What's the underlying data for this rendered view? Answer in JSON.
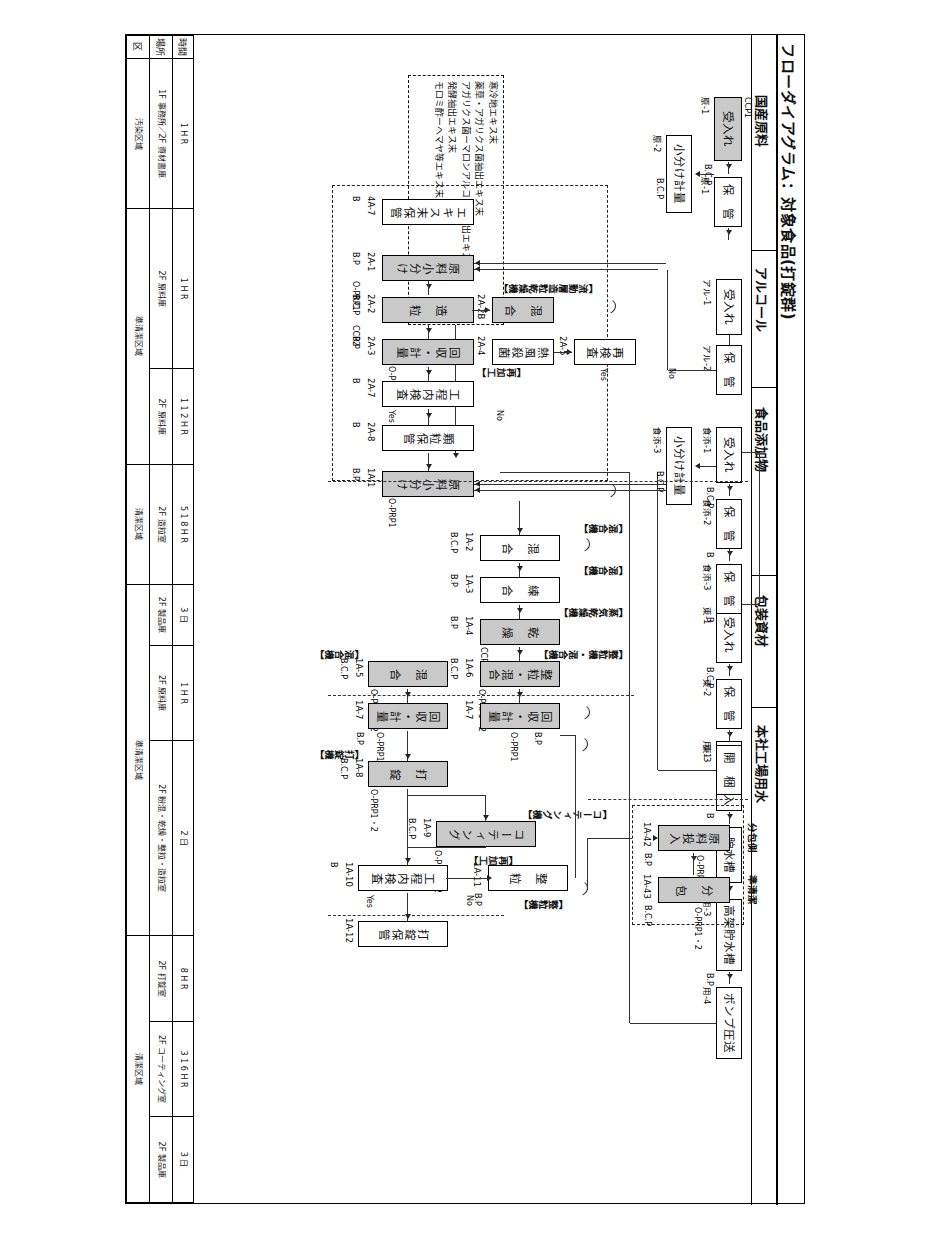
{
  "document": {
    "title": "フローダイアグラム：対象食品(打錠群)",
    "legend_lines": [
      "寒冷地エキス末",
      "薬草・アガリクス菌抽出エキス末",
      "アガリクス菌ーマロンアルコール抽出エキス末",
      "発酵抽出エキス末",
      "モロミ酢ーヘマヤ等エキス末"
    ]
  },
  "lanes": [
    {
      "id": "lane-raw",
      "label": "国産原料"
    },
    {
      "id": "lane-alcohol",
      "label": "アルコール"
    },
    {
      "id": "lane-additive",
      "label": "食品添加物"
    },
    {
      "id": "lane-packaging",
      "label": "包装資材"
    },
    {
      "id": "lane-water",
      "label": "本社工場用水"
    }
  ],
  "water_line": {
    "steps": [
      {
        "code": "用-1",
        "label": "水道水受入",
        "ccp": "",
        "shaded": false
      },
      {
        "code": "用-2",
        "label": "貯水槽",
        "ccp": "B",
        "shaded": false
      },
      {
        "code": "用-3",
        "label": "高架貯水槽",
        "ccp": "B.P",
        "shaded": false
      },
      {
        "code": "用-4",
        "label": "ポンプ圧送",
        "ccp": "B.P",
        "shaded": false
      }
    ]
  },
  "packaging_line": {
    "steps": [
      {
        "code": "東-1",
        "label": "受入れ",
        "ccp": "B.C.P",
        "shaded": false
      },
      {
        "code": "東-2",
        "label": "保　管",
        "ccp": "",
        "shaded": false
      },
      {
        "code": "東-3",
        "label": "開　梱",
        "ccp": "",
        "shaded": false
      }
    ]
  },
  "additive_line": {
    "steps": [
      {
        "code": "食添-1",
        "label": "受入れ",
        "ccp": "B.C.P",
        "shaded": false
      },
      {
        "code": "食添-2",
        "label": "保　管",
        "ccp": "B",
        "shaded": false
      },
      {
        "code": "食添-3",
        "label": "保　管",
        "ccp": "B",
        "shaded": false
      },
      {
        "code": "食添-3",
        "label": "小分け計量",
        "ccp": "B.C.P",
        "shaded": false
      }
    ]
  },
  "alcohol_line": {
    "steps": [
      {
        "code": "アル-1",
        "label": "受入れ",
        "ccp": "",
        "shaded": false
      },
      {
        "code": "アル-2",
        "label": "保　管",
        "ccp": "",
        "shaded": false
      }
    ]
  },
  "raw_line": {
    "steps": [
      {
        "code": "原-1",
        "label": "受入れ",
        "ccp": "B.C.P",
        "ccp2": "CCP1",
        "shaded": true
      },
      {
        "code": "原-1",
        "label": "保　管",
        "ccp": "",
        "shaded": false
      },
      {
        "code": "原-2",
        "label": "小分け計量",
        "ccp": "B.C.P",
        "shaded": false
      }
    ]
  },
  "process_2A": {
    "machine_note": "【流動層造粒乾燥機】",
    "steps": [
      {
        "code": "4A-7",
        "label": "エキス末保管",
        "ccp": "B",
        "shaded": false
      },
      {
        "code": "2A-1",
        "label": "原料小分け",
        "ccp": "B.P",
        "ccp2": "O-PRP1",
        "shaded": true
      },
      {
        "code": "2A-2",
        "label": "造　粒",
        "ccp": "B.C.P",
        "ccp2": "CCP2",
        "shaded": true
      },
      {
        "code": "2A-2B",
        "label": "混　合",
        "ccp": "",
        "shaded": true
      },
      {
        "code": "2A-3",
        "label": "回収・計量",
        "ccp": "B.P",
        "ccp2": "O-PRP1",
        "shaded": true
      },
      {
        "code": "2A-4",
        "label": "熱風殺菌",
        "ccp": "",
        "shaded": false
      },
      {
        "code": "2A-5",
        "label": "再検査",
        "ccp": "",
        "shaded": false
      },
      {
        "code": "2A-7",
        "label": "工程内検査",
        "ccp": "B",
        "shaded": false
      },
      {
        "code": "2A-8",
        "label": "顆粒保管",
        "ccp": "B",
        "shaded": false
      }
    ],
    "rework_note": "【再加工】",
    "yes": "Yes",
    "no": "No"
  },
  "process_1A": {
    "machine_notes": [
      "【混合機】",
      "【混合機】",
      "【蒸気乾燥機】",
      "【整粒機・混合機】",
      "【混合機】",
      "【打錠機】",
      "【コーティング機】",
      "【整粒機】"
    ],
    "steps": [
      {
        "code": "1A-1",
        "label": "原料小分け",
        "ccp": "B.P",
        "ccp2": "O-PRP1",
        "shaded": true
      },
      {
        "code": "1A-2",
        "label": "混　合",
        "ccp": "B.C.P",
        "shaded": false
      },
      {
        "code": "1A-3",
        "label": "練　合",
        "ccp": "B.P",
        "shaded": false
      },
      {
        "code": "1A-4",
        "label": "乾　燥",
        "ccp": "B.P",
        "ccp2": "CCP3",
        "shaded": true
      },
      {
        "code": "1A-6",
        "label": "整粒・混合",
        "ccp": "B.C.P",
        "ccp2": "O-PRP1・2",
        "shaded": true
      },
      {
        "code": "1A-7",
        "label": "回収・計量",
        "ccp": "B.P",
        "ccp2": "O-PRP1",
        "shaded": true
      },
      {
        "code": "1A-5",
        "label": "混　合",
        "ccp": "B.C.P",
        "ccp2": "O-PRP1・2",
        "shaded": true
      },
      {
        "code": "1A-7",
        "label": "回収・計量",
        "ccp": "B.P",
        "ccp2": "O-PRP1",
        "shaded": true
      },
      {
        "code": "1A-8",
        "label": "打　錠",
        "ccp": "B.C.P",
        "ccp2": "O-PRP1・2",
        "shaded": true
      },
      {
        "code": "1A-9",
        "label": "コーティング",
        "ccp": "B.C.P",
        "ccp2": "O-PRP1・2",
        "shaded": true
      },
      {
        "code": "1A-10",
        "label": "工程内検査",
        "ccp": "B",
        "shaded": false
      },
      {
        "code": "1A-11",
        "label": "整　粒",
        "ccp": "B.P",
        "shaded": false
      },
      {
        "code": "1A-12",
        "label": "打錠保管",
        "ccp": "",
        "shaded": false
      },
      {
        "code": "1A-42",
        "label": "原料投入",
        "ccp": "B.P",
        "ccp2": "O-PRP1",
        "shaded": true
      },
      {
        "code": "1A-43",
        "label": "分　包",
        "ccp": "B.C.P",
        "ccp2": "O-PRP1・2",
        "shaded": true
      }
    ],
    "rework_note": "【再加工】",
    "yes": "Yes",
    "no": "No"
  },
  "right_notes": {
    "bunpou": "分包側",
    "junsei": "準清潔"
  },
  "table": {
    "row_labels": [
      "時間",
      "場所",
      "区"
    ],
    "columns": [
      {
        "time": [
          "1",
          "H",
          "R"
        ],
        "place": "1F 事務所\n2F 資材書庫",
        "zone": "汚染区域",
        "w": 150
      },
      {
        "time": [
          "1",
          "H",
          "R"
        ],
        "place": "2F 原料庫",
        "zone": "準清潔区域",
        "w": 160
      },
      {
        "time": [
          "1",
          "1",
          "2",
          "H",
          "R"
        ],
        "place": "2F 原料庫",
        "zone": "準清潔区域",
        "w": 95
      },
      {
        "time": [
          "5",
          "1",
          "8",
          "H",
          "R"
        ],
        "place": "2F 造粒室",
        "zone": "清潔区域",
        "w": 120
      },
      {
        "time": [
          "3",
          "日"
        ],
        "place": "2F 製品庫",
        "zone": "清潔区域",
        "w": 60
      },
      {
        "time": [
          "1",
          "H",
          "R"
        ],
        "place": "2F 原料庫",
        "zone": "準清潔区域",
        "w": 95
      },
      {
        "time": [
          "2",
          "日"
        ],
        "place": "2F 粉混・乾燥・整粒・造粒室",
        "zone": "準清潔区域",
        "w": 195
      },
      {
        "time": [
          "8",
          "H",
          "R"
        ],
        "place": "2F 打錠室",
        "zone": "清潔区域",
        "w": 85
      },
      {
        "time": [
          "3",
          "1",
          "6",
          "H",
          "R"
        ],
        "place": "2F コーティング室",
        "zone": "清潔区域",
        "w": 95
      },
      {
        "time": [
          "3",
          "日"
        ],
        "place": "2F 製品庫",
        "zone": "清潔区域",
        "w": 85
      }
    ]
  },
  "colors": {
    "shaded_box": "#c9c9c9",
    "line": "#333333",
    "border": "#000000"
  }
}
